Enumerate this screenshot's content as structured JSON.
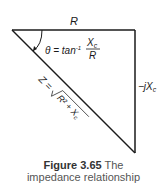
{
  "diagram": {
    "type": "impedance-triangle",
    "labels": {
      "top_side": "R",
      "right_side": "−jX",
      "right_side_sub": "c",
      "angle_prefix": "θ = tan",
      "angle_sup": "-1",
      "angle_num": "X",
      "angle_num_sub": "c",
      "angle_den": "R",
      "hyp_prefix": "Z = ",
      "hyp_radicand": "R² + X",
      "hyp_radicand_sub": "c"
    },
    "colors": {
      "line": "#1a1a1a",
      "text": "#1a1a1a",
      "caption": "#555555"
    }
  },
  "caption": {
    "figure": "Figure 3.65",
    "text_line1": "The",
    "text_line2": "impedance relationship"
  }
}
